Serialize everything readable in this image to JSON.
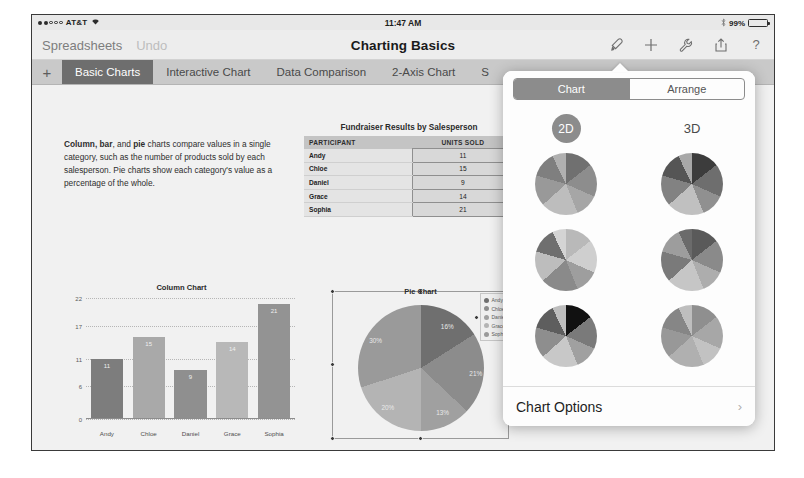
{
  "status_bar": {
    "carrier": "AT&T",
    "signal_dots_filled": 2,
    "signal_dots_total": 5,
    "wifi_icon": "wifi-icon",
    "time": "11:47 AM",
    "bluetooth_icon": "bluetooth-icon",
    "battery_percent": "99%",
    "battery_level": 99
  },
  "nav_bar": {
    "back_label": "Spreadsheets",
    "undo_label": "Undo",
    "title": "Charting Basics",
    "icons": [
      {
        "name": "format-brush-icon",
        "active": true
      },
      {
        "name": "insert-plus-icon",
        "active": false
      },
      {
        "name": "tools-wrench-icon",
        "active": false
      },
      {
        "name": "share-export-icon",
        "active": false
      },
      {
        "name": "help-question-icon",
        "active": false
      }
    ]
  },
  "tab_bar": {
    "add_label": "+",
    "tabs": [
      {
        "label": "Basic Charts",
        "active": true
      },
      {
        "label": "Interactive Chart",
        "active": false
      },
      {
        "label": "Data Comparison",
        "active": false
      },
      {
        "label": "2-Axis Chart",
        "active": false
      },
      {
        "label": "S",
        "active": false
      }
    ]
  },
  "sheet": {
    "description_lead": "Column, bar",
    "description_mid": ", and ",
    "description_bold2": "pie",
    "description_rest": " charts compare values in a single category, such as the number of products sold by each salesperson. Pie charts show each category's value as a percentage of the whole.",
    "table": {
      "title": "Fundraiser Results by Salesperson",
      "columns": [
        "PARTICIPANT",
        "UNITS SOLD"
      ],
      "rows": [
        [
          "Andy",
          "11"
        ],
        [
          "Chloe",
          "15"
        ],
        [
          "Daniel",
          "9"
        ],
        [
          "Grace",
          "14"
        ],
        [
          "Sophia",
          "21"
        ]
      ]
    }
  },
  "chart_data": [
    {
      "type": "bar",
      "title": "Column Chart",
      "categories": [
        "Andy",
        "Chloe",
        "Daniel",
        "Grace",
        "Sophia"
      ],
      "values": [
        11,
        15,
        9,
        14,
        21
      ],
      "data_labels": [
        "11",
        "15",
        "9",
        "14",
        "21"
      ],
      "yticks": [
        0,
        6,
        11,
        17,
        22
      ],
      "ylim": [
        0,
        22
      ],
      "xlabel": "",
      "ylabel": "",
      "grid": true,
      "legend": "none",
      "bar_colors": [
        "#7d7d7d",
        "#a9a9a9",
        "#8f8f8f",
        "#b8b8b8",
        "#939393"
      ]
    },
    {
      "type": "pie",
      "title": "Pie Chart",
      "categories": [
        "Andy",
        "Chloe",
        "Daniel",
        "Grace",
        "Sophia"
      ],
      "values": [
        11,
        15,
        9,
        14,
        21
      ],
      "percent_labels": [
        "16%",
        "21%",
        "13%",
        "20%",
        "30%"
      ],
      "percents": [
        16,
        21,
        13,
        20,
        30
      ],
      "legend": "right",
      "selected": true,
      "slice_colors": [
        "#6f6f6f",
        "#8c8c8c",
        "#a0a0a0",
        "#b4b4b4",
        "#9a9a9a"
      ]
    }
  ],
  "popover": {
    "segments": [
      {
        "label": "Chart",
        "active": true
      },
      {
        "label": "Arrange",
        "active": false
      }
    ],
    "dimensions": [
      {
        "label": "2D",
        "active": true
      },
      {
        "label": "3D",
        "active": false
      }
    ],
    "thumbnails": [
      {
        "name": "pie-style-1",
        "dimension": "2D"
      },
      {
        "name": "pie-style-2",
        "dimension": "3D"
      },
      {
        "name": "pie-style-3",
        "dimension": "2D"
      },
      {
        "name": "pie-style-4",
        "dimension": "3D"
      },
      {
        "name": "pie-style-5",
        "dimension": "2D"
      },
      {
        "name": "pie-style-6",
        "dimension": "3D"
      }
    ],
    "chart_options_label": "Chart Options",
    "chevron": "›"
  }
}
